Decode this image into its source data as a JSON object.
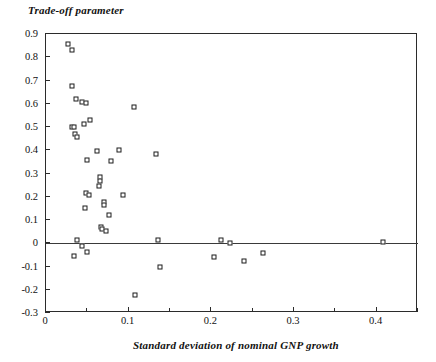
{
  "chart_data": {
    "type": "scatter",
    "title": "",
    "ylabel": "Trade-off parameter",
    "xlabel": "Standard deviation of nominal GNP growth",
    "xlim": [
      0,
      0.45
    ],
    "ylim": [
      -0.3,
      0.9
    ],
    "grid": false,
    "legend": null,
    "zero_line": 0,
    "x_ticks_major": [
      0,
      0.1,
      0.2,
      0.3,
      0.4
    ],
    "x_tick_labels": [
      "0",
      "0.1",
      "0.2",
      "0.3",
      "0.4"
    ],
    "x_ticks_minor": [
      0.05,
      0.15,
      0.25,
      0.35,
      0.45
    ],
    "y_ticks": [
      0.9,
      0.8,
      0.7,
      0.6,
      0.5,
      0.4,
      0.3,
      0.2,
      0.1,
      0,
      -0.1,
      -0.2,
      -0.3
    ],
    "y_tick_labels": [
      "0.9",
      "0.8",
      "0.7",
      "0.6",
      "0.5",
      "0.4",
      "0.3",
      "0.2",
      "0.1",
      "0",
      "-0.1",
      "-0.2",
      "-0.3"
    ],
    "marker": "open-square",
    "marker_color": "#1c1c1c",
    "points": [
      {
        "x": 0.027,
        "y": 0.855
      },
      {
        "x": 0.032,
        "y": 0.832
      },
      {
        "x": 0.031,
        "y": 0.675
      },
      {
        "x": 0.036,
        "y": 0.622
      },
      {
        "x": 0.044,
        "y": 0.608
      },
      {
        "x": 0.048,
        "y": 0.603
      },
      {
        "x": 0.107,
        "y": 0.588
      },
      {
        "x": 0.053,
        "y": 0.528
      },
      {
        "x": 0.046,
        "y": 0.512
      },
      {
        "x": 0.032,
        "y": 0.502
      },
      {
        "x": 0.034,
        "y": 0.498
      },
      {
        "x": 0.035,
        "y": 0.472
      },
      {
        "x": 0.037,
        "y": 0.455
      },
      {
        "x": 0.062,
        "y": 0.398
      },
      {
        "x": 0.088,
        "y": 0.4
      },
      {
        "x": 0.133,
        "y": 0.382
      },
      {
        "x": 0.05,
        "y": 0.36
      },
      {
        "x": 0.079,
        "y": 0.355
      },
      {
        "x": 0.065,
        "y": 0.283
      },
      {
        "x": 0.065,
        "y": 0.268
      },
      {
        "x": 0.064,
        "y": 0.248
      },
      {
        "x": 0.048,
        "y": 0.218
      },
      {
        "x": 0.052,
        "y": 0.208
      },
      {
        "x": 0.093,
        "y": 0.208
      },
      {
        "x": 0.07,
        "y": 0.178
      },
      {
        "x": 0.07,
        "y": 0.163
      },
      {
        "x": 0.047,
        "y": 0.15
      },
      {
        "x": 0.076,
        "y": 0.122
      },
      {
        "x": 0.067,
        "y": 0.068
      },
      {
        "x": 0.068,
        "y": 0.062
      },
      {
        "x": 0.072,
        "y": 0.052
      },
      {
        "x": 0.037,
        "y": 0.015
      },
      {
        "x": 0.135,
        "y": 0.013
      },
      {
        "x": 0.212,
        "y": 0.013
      },
      {
        "x": 0.222,
        "y": 0.002
      },
      {
        "x": 0.408,
        "y": 0.004
      },
      {
        "x": 0.044,
        "y": -0.012
      },
      {
        "x": 0.05,
        "y": -0.038
      },
      {
        "x": 0.034,
        "y": -0.055
      },
      {
        "x": 0.203,
        "y": -0.06
      },
      {
        "x": 0.262,
        "y": -0.04
      },
      {
        "x": 0.138,
        "y": -0.1
      },
      {
        "x": 0.24,
        "y": -0.075
      },
      {
        "x": 0.108,
        "y": -0.222
      }
    ]
  }
}
